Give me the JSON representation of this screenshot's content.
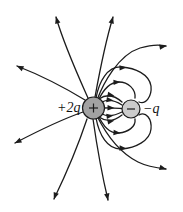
{
  "figure": {
    "width": 183,
    "height": 212,
    "background": "#ffffff",
    "line_color": "#1c1c1c",
    "line_width": 1.3
  },
  "charges": {
    "positive": {
      "label": "+2q",
      "symbol": "plus",
      "cx": 93.5,
      "cy": 108,
      "r": 11,
      "fill": "#a2a2a2",
      "stroke": "#1c1c1c",
      "symbol_half": 4.5
    },
    "negative": {
      "label": "−q",
      "symbol": "minus",
      "cx": 131,
      "cy": 109,
      "r": 9,
      "fill": "#cccccc",
      "stroke": "#1c1c1c",
      "symbol_half": 4
    }
  },
  "field_lines": [
    {
      "name": "up-left",
      "d": "M 85 100 C 62 86, 40 75, 17 66"
    },
    {
      "name": "up",
      "d": "M 88 98 C 80 80, 64 45, 56 17"
    },
    {
      "name": "up-right",
      "d": "M 95 97 C 99 75, 106 40, 113 17"
    },
    {
      "name": "right-upper",
      "d": "M 97 100 C 103 84, 118 55, 140 48 C 150 45, 158 44, 166 46"
    },
    {
      "name": "left-down",
      "d": "M 83 112 C 60 120, 36 132, 15 143"
    },
    {
      "name": "down",
      "d": "M 87 119 C 80 140, 68 170, 54 199"
    },
    {
      "name": "down-center",
      "d": "M 93 119 C 96 140, 102 175, 108 200"
    },
    {
      "name": "right-lower",
      "d": "M 97 116 C 104 130, 118 152, 138 162 C 148 167, 157 168, 166 169"
    },
    {
      "name": "loop-upper-outer",
      "d": "M 96 98 C 99 82, 107 66, 122 67 C 135 68, 149 74, 151 86 C 152 96, 146 105, 139 102"
    },
    {
      "name": "loop-upper-middle",
      "d": "M 98 101 C 103 90, 110 82, 119 82 C 128 82, 136 89, 135 98"
    },
    {
      "name": "loop-lower-outer",
      "d": "M 96 118 C 99 134, 107 150, 122 149 C 135 148, 150 141, 151 129 C 152 119, 146 111, 139 115"
    },
    {
      "name": "loop-lower-middle",
      "d": "M 98 115 C 103 126, 110 134, 119 133 C 128 132, 136 127, 135 119"
    },
    {
      "name": "direct-1",
      "d": "M 99 99 C 106 94, 113 94, 122 102"
    },
    {
      "name": "direct-2",
      "d": "M 102 102 C 108 99, 114 100, 122 105"
    },
    {
      "name": "direct-3",
      "d": "M 104 108 C 110 107.5, 115 108, 121.5 108.5"
    },
    {
      "name": "direct-4",
      "d": "M 102 114 C 108 117, 114 116, 122 112"
    },
    {
      "name": "direct-5",
      "d": "M 99 117 C 106 122, 113 122, 122 115"
    }
  ],
  "arrowheads": [
    {
      "x": 17,
      "y": 66,
      "angle": -155
    },
    {
      "x": 56,
      "y": 17,
      "angle": -106
    },
    {
      "x": 113,
      "y": 17,
      "angle": -74
    },
    {
      "x": 166,
      "y": 46,
      "angle": -10
    },
    {
      "x": 15,
      "y": 143,
      "angle": 153
    },
    {
      "x": 54,
      "y": 199,
      "angle": 110
    },
    {
      "x": 108,
      "y": 200,
      "angle": 79
    },
    {
      "x": 166,
      "y": 169,
      "angle": 15
    },
    {
      "x": 126,
      "y": 67.5,
      "angle": -3
    },
    {
      "x": 120,
      "y": 82,
      "angle": -3
    },
    {
      "x": 120,
      "y": 133,
      "angle": 4
    },
    {
      "x": 126,
      "y": 148.5,
      "angle": 4
    },
    {
      "x": 114,
      "y": 95.7,
      "angle": 12
    },
    {
      "x": 113,
      "y": 100.5,
      "angle": 8
    },
    {
      "x": 114,
      "y": 108,
      "angle": 2
    },
    {
      "x": 113,
      "y": 115.5,
      "angle": -8
    },
    {
      "x": 114,
      "y": 120.5,
      "angle": -12
    }
  ]
}
